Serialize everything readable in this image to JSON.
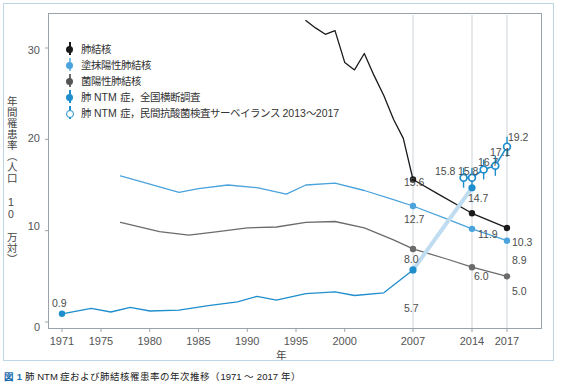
{
  "chart_data": {
    "type": "line",
    "title": "",
    "xlabel": "年",
    "ylabel": "年間罹患率（人口 10 万対）",
    "xlim": [
      1971,
      2017
    ],
    "ylim": [
      0,
      34
    ],
    "yticks": [
      0,
      10,
      20,
      30
    ],
    "xticks": [
      1971,
      1975,
      1980,
      1985,
      1990,
      1995,
      2000,
      2007,
      2014,
      2017
    ],
    "grid": "vertical gridlines at 2007, 2014, 2017",
    "legend_position": "upper-left inside plot",
    "series": [
      {
        "name": "肺結核",
        "color": "#1a1a1a",
        "marker": "filled-circle",
        "points": [
          {
            "x": 1996,
            "y": 33.0
          },
          {
            "x": 1997,
            "y": 32.2
          },
          {
            "x": 1998,
            "y": 31.5
          },
          {
            "x": 1999,
            "y": 31.9
          },
          {
            "x": 2000,
            "y": 28.4
          },
          {
            "x": 2001,
            "y": 27.6
          },
          {
            "x": 2002,
            "y": 29.4
          },
          {
            "x": 2003,
            "y": 27.0
          },
          {
            "x": 2004,
            "y": 24.8
          },
          {
            "x": 2005,
            "y": 22.2
          },
          {
            "x": 2006,
            "y": 20.1
          },
          {
            "x": 2007,
            "y": 15.6
          },
          {
            "x": 2010,
            "y": 14.0
          },
          {
            "x": 2014,
            "y": 11.9
          },
          {
            "x": 2017,
            "y": 10.3
          }
        ],
        "labels": [
          {
            "x": 2007,
            "y": 15.6,
            "text": "15.6"
          },
          {
            "x": 2014,
            "y": 11.9,
            "text": "11.9"
          },
          {
            "x": 2017,
            "y": 10.3,
            "text": "10.3"
          }
        ]
      },
      {
        "name": "塗抹陽性肺結核",
        "color": "#4aa3dd",
        "marker": "filled-circle",
        "points": [
          {
            "x": 1977,
            "y": 16.0
          },
          {
            "x": 1980,
            "y": 15.1
          },
          {
            "x": 1983,
            "y": 14.2
          },
          {
            "x": 1985,
            "y": 14.6
          },
          {
            "x": 1988,
            "y": 15.0
          },
          {
            "x": 1991,
            "y": 14.7
          },
          {
            "x": 1994,
            "y": 14.0
          },
          {
            "x": 1996,
            "y": 15.0
          },
          {
            "x": 1999,
            "y": 15.2
          },
          {
            "x": 2002,
            "y": 14.4
          },
          {
            "x": 2005,
            "y": 13.4
          },
          {
            "x": 2007,
            "y": 12.7
          },
          {
            "x": 2011,
            "y": 11.3
          },
          {
            "x": 2014,
            "y": 10.2
          },
          {
            "x": 2017,
            "y": 8.9
          }
        ],
        "labels": [
          {
            "x": 2007,
            "y": 12.7,
            "text": "12.7"
          },
          {
            "x": 2014,
            "y": 10.2,
            "text": "10.2"
          },
          {
            "x": 2017,
            "y": 8.9,
            "text": "8.9"
          }
        ]
      },
      {
        "name": "菌陽性肺結核",
        "color": "#6b6b6b",
        "marker": "filled-circle",
        "points": [
          {
            "x": 1977,
            "y": 10.9
          },
          {
            "x": 1981,
            "y": 9.9
          },
          {
            "x": 1984,
            "y": 9.5
          },
          {
            "x": 1987,
            "y": 9.9
          },
          {
            "x": 1990,
            "y": 10.3
          },
          {
            "x": 1993,
            "y": 10.4
          },
          {
            "x": 1996,
            "y": 10.9
          },
          {
            "x": 1999,
            "y": 11.0
          },
          {
            "x": 2002,
            "y": 10.3
          },
          {
            "x": 2005,
            "y": 9.0
          },
          {
            "x": 2007,
            "y": 8.0
          },
          {
            "x": 2011,
            "y": 6.9
          },
          {
            "x": 2014,
            "y": 6.0
          },
          {
            "x": 2017,
            "y": 5.0
          }
        ],
        "labels": [
          {
            "x": 2007,
            "y": 8.0,
            "text": "8.0"
          },
          {
            "x": 2014,
            "y": 6.0,
            "text": "6.0"
          },
          {
            "x": 2017,
            "y": 5.0,
            "text": "5.0"
          }
        ]
      },
      {
        "name": "肺 NTM 症，全国横断調査",
        "color": "#1f8ecd",
        "marker": "filled-circle",
        "points": [
          {
            "x": 1971,
            "y": 0.9
          },
          {
            "x": 1974,
            "y": 1.5
          },
          {
            "x": 1976,
            "y": 1.1
          },
          {
            "x": 1978,
            "y": 1.6
          },
          {
            "x": 1980,
            "y": 1.2
          },
          {
            "x": 1983,
            "y": 1.3
          },
          {
            "x": 1986,
            "y": 1.8
          },
          {
            "x": 1989,
            "y": 2.2
          },
          {
            "x": 1991,
            "y": 2.8
          },
          {
            "x": 1993,
            "y": 2.4
          },
          {
            "x": 1996,
            "y": 3.1
          },
          {
            "x": 1999,
            "y": 3.3
          },
          {
            "x": 2001,
            "y": 2.9
          },
          {
            "x": 2004,
            "y": 3.2
          },
          {
            "x": 2007,
            "y": 5.7
          },
          {
            "x": 2014,
            "y": 14.7
          }
        ],
        "labels": [
          {
            "x": 1971,
            "y": 0.9,
            "text": "0.9"
          },
          {
            "x": 2007,
            "y": 5.7,
            "text": "5.7"
          },
          {
            "x": 2014,
            "y": 14.7,
            "text": "14.7"
          }
        ]
      },
      {
        "name": "肺 NTM 症，民間抗酸菌検査サーベイランス 2013〜2017",
        "color": "#1f8ecd",
        "marker": "open-circle-with-errorbar",
        "points": [
          {
            "x": 2013,
            "y": 15.8
          },
          {
            "x": 2014,
            "y": 15.8
          },
          {
            "x": 2015,
            "y": 16.7
          },
          {
            "x": 2016,
            "y": 17.1
          },
          {
            "x": 2017,
            "y": 19.2
          }
        ],
        "labels": [
          {
            "x": 2013,
            "y": 15.8,
            "text": "15.8"
          },
          {
            "x": 2014,
            "y": 15.8,
            "text": "15.8"
          },
          {
            "x": 2015,
            "y": 16.7,
            "text": "16.7"
          },
          {
            "x": 2016,
            "y": 17.1,
            "text": "17.1"
          },
          {
            "x": 2017,
            "y": 19.2,
            "text": "19.2"
          }
        ]
      }
    ]
  },
  "axes": {
    "y_title": "年間罹患率（人口 10 万対）",
    "x_title": "年",
    "y_ticks": [
      "30",
      "20",
      "10",
      "0"
    ],
    "x_ticks": [
      "1971",
      "1975",
      "1980",
      "1985",
      "1990",
      "1995",
      "2000",
      "2007",
      "2014",
      "2017"
    ]
  },
  "legend": {
    "items": [
      {
        "label": "肺結核",
        "marker": "black-dot-marker",
        "color": "#1a1a1a"
      },
      {
        "label": "塗抹陽性肺結核",
        "marker": "light-blue-dot-marker",
        "color": "#4aa3dd"
      },
      {
        "label": "菌陽性肺結核",
        "marker": "gray-dot-marker",
        "color": "#6b6b6b"
      },
      {
        "label": "肺 NTM 症，全国横断調査",
        "marker": "blue-dot-marker",
        "color": "#1f8ecd"
      },
      {
        "label": "肺 NTM 症，民間抗酸菌検査サーベイランス 2013〜2017",
        "marker": "blue-open-circle-marker",
        "color": "#1f8ecd"
      }
    ]
  },
  "data_labels": [
    {
      "text": "0.9",
      "left": 52,
      "top": 297
    },
    {
      "text": "15.6",
      "left": 404,
      "top": 176
    },
    {
      "text": "12.7",
      "left": 404,
      "top": 213
    },
    {
      "text": "8.0",
      "left": 404,
      "top": 253
    },
    {
      "text": "5.7",
      "left": 404,
      "top": 302
    },
    {
      "text": "15.8",
      "left": 435,
      "top": 165
    },
    {
      "text": "15.8",
      "left": 458,
      "top": 165
    },
    {
      "text": "16.7",
      "left": 478,
      "top": 156
    },
    {
      "text": "17.1",
      "left": 490,
      "top": 146
    },
    {
      "text": "19.2",
      "left": 508,
      "top": 131
    },
    {
      "text": "14.7",
      "left": 468,
      "top": 192
    },
    {
      "text": "11.9",
      "left": 478,
      "top": 228
    },
    {
      "text": "6.0",
      "left": 474,
      "top": 270
    },
    {
      "text": "10.3",
      "left": 512,
      "top": 236
    },
    {
      "text": "8.9",
      "left": 512,
      "top": 254
    },
    {
      "text": "5.0",
      "left": 512,
      "top": 285
    }
  ],
  "caption": {
    "tag": "図 1",
    "text": "肺 NTM 症および肺結核罹患率の年次推移（1971 ～ 2017 年）"
  },
  "colors": {
    "tuberculosis": "#1a1a1a",
    "smear_positive": "#4aa3dd",
    "culture_positive": "#6b6b6b",
    "ntm_survey": "#1f8ecd",
    "ntm_surveillance": "#1f8ecd",
    "frame": "#9aa3aa",
    "outer_frame": "#bcd6e8",
    "gridline": "#cfd6da"
  }
}
